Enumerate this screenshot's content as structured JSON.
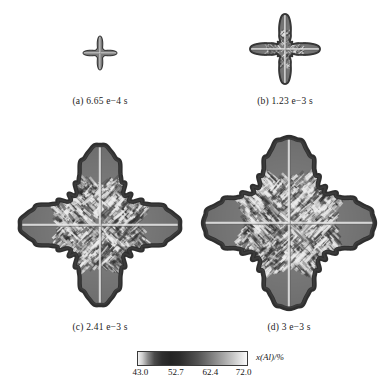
{
  "figure": {
    "background": "#ffffff",
    "panels": [
      {
        "id": "a",
        "caption": "(a) 6.65 e−4 s",
        "time_value": 0.000665,
        "time_text": "6.65 e−4 s",
        "description": "four-pointed star dendrite, smallest, smooth concave edges, bright cross at center",
        "relative_size": 0.18
      },
      {
        "id": "b",
        "caption": "(b) 1.23 e−3 s",
        "time_value": 0.00123,
        "time_text": "1.23 e−3 s",
        "description": "four-pointed star dendrite, grown arms with early sidebranch texture",
        "relative_size": 0.38
      },
      {
        "id": "c",
        "caption": "(c) 2.41 e−3 s",
        "time_value": 0.00241,
        "time_text": "2.41 e−3 s",
        "description": "large diamond dendrite with well developed secondary arms and rough jagged envelope",
        "relative_size": 0.8
      },
      {
        "id": "d",
        "caption": "(d) 3 e−3 s",
        "time_value": 0.003,
        "time_text": "3 e−3 s",
        "description": "largest diamond dendrite, dense secondary and tertiary sidebranching",
        "relative_size": 1.0
      }
    ]
  },
  "colorbar": {
    "label": "x(Al)/%",
    "label_italic_part": "x",
    "label_rest": "(Al)/%",
    "ticks": [
      "43.0",
      "52.7",
      "62.4",
      "72.0"
    ],
    "tick_values": [
      43.0,
      52.7,
      62.4,
      72.0
    ],
    "min": 43.0,
    "max": 72.0,
    "orientation": "horizontal",
    "gradient_description": "light at low end, dark through mid-low, brightening to white at high end",
    "colors": [
      "#f2f2f2",
      "#242424",
      "#6e6e6e",
      "#fbfbfb"
    ]
  },
  "chart_data": {
    "type": "heatmap",
    "title": "",
    "xlabel": "",
    "ylabel": "",
    "legend": "x(Al)/%",
    "colorbar_range": [
      43.0,
      72.0
    ],
    "colorbar_ticks": [
      43.0,
      52.7,
      62.4,
      72.0
    ],
    "panels": [
      "(a) 6.65 e−4 s",
      "(b) 1.23 e−3 s",
      "(c) 2.41 e−3 s",
      "(d) 3 e−3 s"
    ],
    "series": [
      {
        "name": "(a) 6.65 e−4 s",
        "values": [
          0.18
        ]
      },
      {
        "name": "(b) 1.23 e−3 s",
        "values": [
          0.38
        ]
      },
      {
        "name": "(c) 2.41 e−3 s",
        "values": [
          0.8
        ]
      },
      {
        "name": "(d) 3 e−3 s",
        "values": [
          1.0
        ]
      }
    ]
  }
}
